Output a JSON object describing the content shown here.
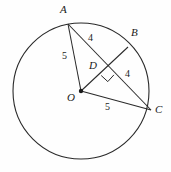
{
  "figure": {
    "type": "circle-geometry-diagram",
    "background_color": "#fefefe",
    "stroke_color": "#2a2a2a"
  },
  "points": {
    "A": {
      "label": "A",
      "x": 68,
      "y": 24,
      "label_x": 62,
      "label_y": 6
    },
    "B": {
      "label": "B",
      "x": 128,
      "y": 47,
      "label_x": 133,
      "label_y": 29
    },
    "C": {
      "label": "C",
      "x": 151,
      "y": 110,
      "label_x": 156,
      "label_y": 106
    },
    "D": {
      "label": "D",
      "x": 107,
      "y": 69,
      "label_x": 91,
      "label_y": 62
    },
    "O": {
      "label": "O",
      "x": 81,
      "y": 91,
      "label_x": 69,
      "label_y": 94
    }
  },
  "circle": {
    "center_x": 81,
    "center_y": 91,
    "radius": 68
  },
  "segments": [
    {
      "name": "OA",
      "from": "O",
      "to": "A"
    },
    {
      "name": "AC",
      "from": "A",
      "to": "C"
    },
    {
      "name": "OB",
      "from": "O",
      "to": "B"
    },
    {
      "name": "OC",
      "from": "O",
      "to": "C"
    }
  ],
  "measures": [
    {
      "name": "OA-length",
      "value": "5",
      "x": 64,
      "y": 55
    },
    {
      "name": "AD-length",
      "value": "4",
      "x": 90,
      "y": 37
    },
    {
      "name": "DC-length",
      "value": "4",
      "x": 127,
      "y": 73
    },
    {
      "name": "OC-length",
      "value": "5",
      "x": 107,
      "y": 106
    }
  ],
  "right_angle": {
    "name": "right-angle-at-D",
    "vertex_x": 107,
    "vertex_y": 69,
    "size": 9
  }
}
